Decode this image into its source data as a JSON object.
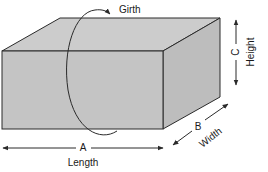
{
  "diagram": {
    "type": "package-dimensions",
    "labels": {
      "girth": "Girth",
      "length_letter": "A",
      "length": "Length",
      "width_letter": "B",
      "width": "Width",
      "height_letter": "C",
      "height": "Height"
    },
    "colors": {
      "front_face": "#c4c4c4",
      "top_face": "#cccccc",
      "side_face": "#bdbdbd",
      "stroke": "#2a2a2a"
    }
  }
}
